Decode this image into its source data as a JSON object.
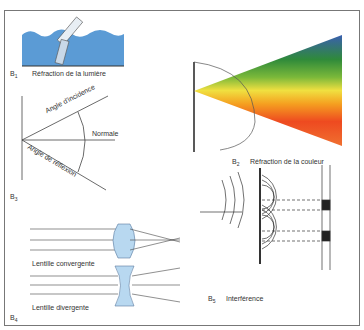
{
  "panels": {
    "b1": {
      "id": "B",
      "sub": "1",
      "caption": "Réfraction de la lumière"
    },
    "b2": {
      "id": "B",
      "sub": "2",
      "caption": "Réfraction de la couleur"
    },
    "b3": {
      "id": "B",
      "sub": "3",
      "labels": {
        "incidence": "Angle d'incidence",
        "normal": "Normale",
        "reflection": "Angle de réflexion"
      }
    },
    "b4": {
      "id": "B",
      "sub": "4",
      "labels": {
        "convergent": "Lentille convergente",
        "divergent": "Lentille divergente"
      }
    },
    "b5": {
      "id": "B",
      "sub": "5",
      "caption": "Interférence"
    }
  },
  "colors": {
    "water": "#5b9bd5",
    "lens": "#b8d8f0",
    "line": "#444444",
    "frame": "#777777"
  }
}
